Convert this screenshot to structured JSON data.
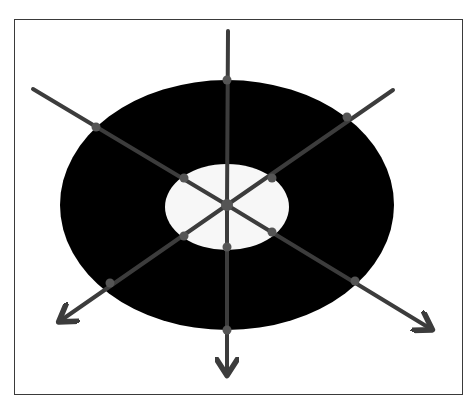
{
  "diagram": {
    "type": "annulus-with-radial-arrows",
    "center": [
      227,
      205
    ],
    "outer_ellipse": {
      "cx": 227,
      "cy": 205,
      "rx": 167,
      "ry": 125,
      "color": "#000000"
    },
    "inner_ellipse": {
      "cx": 227,
      "cy": 207,
      "rx": 62,
      "ry": 43,
      "color": "#ffffff"
    },
    "line_color": "#3c3c3c",
    "node_color": "#555555",
    "rays": [
      {
        "name": "top",
        "end": [
          228,
          31
        ],
        "arrow": false
      },
      {
        "name": "top-left",
        "end": [
          33,
          89
        ],
        "arrow": false
      },
      {
        "name": "top-right",
        "end": [
          393,
          90
        ],
        "arrow": false
      },
      {
        "name": "bottom",
        "end": [
          227,
          374
        ],
        "arrow": true
      },
      {
        "name": "bottom-left",
        "end": [
          60,
          321
        ],
        "arrow": true
      },
      {
        "name": "bottom-right",
        "end": [
          431,
          329
        ],
        "arrow": true
      }
    ],
    "nodes": [
      [
        227,
        205
      ],
      [
        227,
        80
      ],
      [
        96,
        127
      ],
      [
        347,
        117
      ],
      [
        184,
        178
      ],
      [
        272,
        178
      ],
      [
        184,
        236
      ],
      [
        272,
        232
      ],
      [
        227,
        247
      ],
      [
        110,
        283
      ],
      [
        355,
        281
      ],
      [
        227,
        330
      ]
    ]
  }
}
